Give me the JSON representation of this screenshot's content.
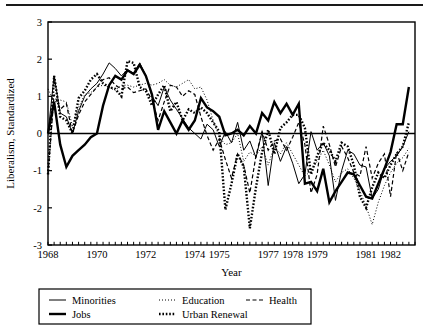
{
  "figure": {
    "name": "liberalism-time-series-figure",
    "has_top_rule": true,
    "background_color": "#ffffff",
    "ink_color": "#000000"
  },
  "chart_data": {
    "type": "line",
    "title": "",
    "xlabel": "Year",
    "ylabel": "Liberalism, Standardized",
    "xlim": [
      1968.0,
      1983.0
    ],
    "ylim": [
      -3,
      3
    ],
    "grid": false,
    "zero_line": 0,
    "legend_position": "below-plot",
    "x_tick_labels": [
      "1968",
      "1970",
      "1972",
      "1974",
      "1975",
      "1977",
      "1978",
      "1979",
      "1981",
      "1982"
    ],
    "x_tick_values": [
      1968,
      1970,
      1972,
      1974,
      1975,
      1977,
      1978,
      1979,
      1981,
      1982
    ],
    "x_minor_tick_interval": 0.25,
    "y_tick_labels": [
      "3",
      "2",
      "1",
      "0",
      "-1",
      "-2",
      "-3"
    ],
    "y_tick_values": [
      3,
      2,
      1,
      0,
      -1,
      -2,
      -3
    ],
    "x": [
      1968.0,
      1968.25,
      1968.5,
      1968.75,
      1969.0,
      1969.25,
      1969.5,
      1969.75,
      1970.0,
      1970.25,
      1970.5,
      1970.75,
      1971.0,
      1971.25,
      1971.5,
      1971.75,
      1972.0,
      1972.25,
      1972.5,
      1972.75,
      1973.0,
      1973.25,
      1973.5,
      1973.75,
      1974.0,
      1974.25,
      1974.5,
      1974.75,
      1975.0,
      1975.25,
      1975.5,
      1975.75,
      1976.0,
      1976.25,
      1976.5,
      1976.75,
      1977.0,
      1977.25,
      1977.5,
      1977.75,
      1978.0,
      1978.25,
      1978.5,
      1978.75,
      1979.0,
      1979.25,
      1979.5,
      1979.75,
      1980.0,
      1980.25,
      1980.5,
      1980.75,
      1981.0,
      1981.25,
      1981.5,
      1981.75,
      1982.0,
      1982.25,
      1982.5,
      1982.75
    ],
    "series": [
      {
        "name": "Minorities",
        "style": "thin-solid",
        "line_width": 1.0,
        "dash": "none",
        "values": [
          0.0,
          1.55,
          0.55,
          0.45,
          0.0,
          0.6,
          1.0,
          1.2,
          1.35,
          1.6,
          1.9,
          1.75,
          1.55,
          1.72,
          1.62,
          1.9,
          1.55,
          1.0,
          0.75,
          1.25,
          0.9,
          0.65,
          0.4,
          0.15,
          0.0,
          -0.15,
          0.25,
          0.1,
          -0.35,
          0.05,
          -0.25,
          0.3,
          -0.45,
          -0.2,
          -0.65,
          0.05,
          -1.4,
          -0.25,
          -0.75,
          -0.35,
          -0.8,
          -1.35,
          -1.1,
          0.05,
          -0.45,
          -0.25,
          -0.6,
          -1.8,
          -1.0,
          -0.45,
          -0.55,
          -0.85,
          -0.9,
          -1.75,
          -1.5,
          -0.95,
          -0.75,
          -0.6,
          -0.35,
          0.05
        ]
      },
      {
        "name": "Jobs",
        "style": "thick-solid",
        "line_width": 2.4,
        "dash": "none",
        "values": [
          0.0,
          0.85,
          -0.3,
          -0.9,
          -0.6,
          -0.45,
          -0.3,
          -0.1,
          0.0,
          0.75,
          1.3,
          1.55,
          1.45,
          1.7,
          1.6,
          1.85,
          1.55,
          1.05,
          0.1,
          0.6,
          0.3,
          0.0,
          0.35,
          0.1,
          0.35,
          0.95,
          0.7,
          0.6,
          0.45,
          -0.05,
          0.0,
          0.1,
          -0.05,
          0.2,
          0.0,
          0.55,
          0.35,
          0.85,
          0.55,
          0.8,
          0.5,
          0.8,
          -1.35,
          -1.3,
          -1.55,
          -0.95,
          -1.85,
          -1.55,
          -1.3,
          -1.05,
          -1.1,
          -1.4,
          -1.7,
          -1.75,
          -1.35,
          -0.95,
          -0.5,
          0.25,
          0.25,
          1.25
        ]
      },
      {
        "name": "Education",
        "style": "fine-dotted",
        "line_width": 1.0,
        "dash": "1,2",
        "values": [
          1.2,
          0.85,
          0.9,
          0.85,
          0.2,
          0.7,
          1.05,
          1.1,
          1.25,
          1.3,
          1.25,
          1.15,
          1.3,
          1.3,
          1.25,
          1.3,
          1.35,
          1.3,
          1.35,
          1.45,
          1.3,
          1.25,
          1.35,
          1.45,
          1.2,
          1.25,
          0.9,
          0.35,
          -0.1,
          -0.3,
          -0.25,
          0.0,
          -0.75,
          -0.5,
          -0.6,
          -0.35,
          -0.85,
          -0.35,
          -0.55,
          -0.25,
          -0.55,
          -0.85,
          -1.15,
          -1.0,
          -0.75,
          -0.45,
          -0.85,
          -1.3,
          -1.05,
          -0.95,
          -1.2,
          -1.55,
          -1.95,
          -2.45,
          -1.85,
          -1.4,
          -1.05,
          -0.8,
          -0.65,
          -0.4
        ]
      },
      {
        "name": "Urban Renewal",
        "style": "thick-dotted",
        "line_width": 2.4,
        "dash": "1.6,1.8",
        "values": [
          -1.1,
          1.55,
          0.45,
          0.35,
          0.0,
          0.95,
          1.15,
          1.45,
          1.6,
          1.35,
          1.25,
          1.2,
          1.0,
          1.95,
          1.9,
          1.25,
          1.15,
          0.75,
          1.05,
          1.3,
          0.6,
          0.85,
          0.35,
          0.65,
          0.55,
          0.7,
          0.55,
          0.3,
          0.05,
          -2.05,
          -1.35,
          -0.55,
          -0.9,
          -2.55,
          -1.45,
          -0.5,
          0.1,
          -0.55,
          0.15,
          0.3,
          0.5,
          0.5,
          0.15,
          -1.1,
          -0.6,
          -0.25,
          -0.45,
          -0.75,
          -0.25,
          -0.35,
          -0.85,
          -1.7,
          -2.0,
          -1.45,
          -1.05,
          -1.2,
          -0.85,
          -0.55,
          -0.35,
          0.3
        ]
      },
      {
        "name": "Health",
        "style": "dashed",
        "line_width": 1.2,
        "dash": "4,2.5",
        "values": [
          -1.1,
          1.05,
          0.65,
          0.8,
          0.0,
          0.5,
          0.85,
          1.05,
          1.25,
          1.45,
          1.5,
          1.3,
          1.2,
          1.25,
          1.1,
          1.15,
          1.2,
          0.9,
          0.35,
          0.85,
          1.3,
          1.25,
          1.0,
          1.15,
          1.05,
          0.45,
          -0.05,
          -0.45,
          -0.15,
          -0.7,
          -1.2,
          -0.55,
          -0.85,
          -1.6,
          -0.6,
          0.05,
          -0.45,
          -0.2,
          -0.15,
          -0.45,
          -0.1,
          0.3,
          -0.3,
          -1.6,
          -1.1,
          0.2,
          -0.3,
          -0.9,
          -0.35,
          -0.65,
          -1.05,
          -1.15,
          -0.35,
          -1.2,
          -0.8,
          -0.55,
          -1.7,
          -0.5,
          -1.0,
          -0.5
        ]
      }
    ]
  },
  "legend": {
    "entries": [
      {
        "label": "Minorities",
        "style": "thin-solid"
      },
      {
        "label": "Jobs",
        "style": "thick-solid"
      },
      {
        "label": "Education",
        "style": "fine-dotted"
      },
      {
        "label": "Urban Renewal",
        "style": "thick-dotted"
      },
      {
        "label": "Health",
        "style": "dashed"
      }
    ]
  }
}
